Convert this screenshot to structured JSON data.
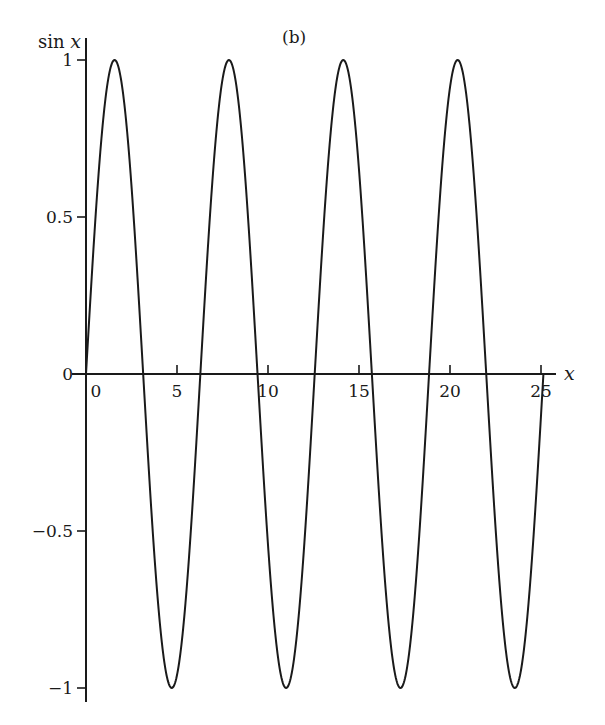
{
  "chart_data": {
    "type": "line",
    "title": "",
    "panel_label": "(b)",
    "xlabel": "x",
    "ylabel_prefix": "sin ",
    "ylabel_var": "x",
    "function": "sin(x)",
    "xlim": [
      0,
      25.8
    ],
    "ylim": [
      -1.05,
      1.05
    ],
    "x_range_plotted": [
      0,
      25.13
    ],
    "xticks": [
      0,
      5,
      10,
      15,
      20,
      25
    ],
    "xtick_labels": [
      "0",
      "5",
      "10",
      "15",
      "20",
      "25"
    ],
    "yticks": [
      1,
      0.5,
      0,
      -0.5,
      -1
    ],
    "ytick_labels": [
      "1",
      "0.5",
      "0",
      "−0.5",
      "−1"
    ],
    "grid": false,
    "legend": null,
    "series": [
      {
        "name": "sin x",
        "color": "#1a1a1a",
        "key_points": [
          {
            "x": 0,
            "y": 0
          },
          {
            "x": 1.571,
            "y": 1
          },
          {
            "x": 3.142,
            "y": 0
          },
          {
            "x": 4.712,
            "y": -1
          },
          {
            "x": 6.283,
            "y": 0
          },
          {
            "x": 7.854,
            "y": 1
          },
          {
            "x": 9.425,
            "y": 0
          },
          {
            "x": 10.996,
            "y": -1
          },
          {
            "x": 12.566,
            "y": 0
          },
          {
            "x": 14.137,
            "y": 1
          },
          {
            "x": 15.708,
            "y": 0
          },
          {
            "x": 17.279,
            "y": -1
          },
          {
            "x": 18.85,
            "y": 0
          },
          {
            "x": 20.42,
            "y": 1
          },
          {
            "x": 21.991,
            "y": 0
          },
          {
            "x": 23.562,
            "y": -1
          },
          {
            "x": 25.133,
            "y": 0
          }
        ]
      }
    ]
  },
  "layout": {
    "origin_px": [
      86,
      374
    ],
    "x_unit_px": 18.2,
    "y_unit_px": 314,
    "x_axis_end_px": 556,
    "y_axis_top_px": 38,
    "y_axis_bottom_px": 702
  }
}
